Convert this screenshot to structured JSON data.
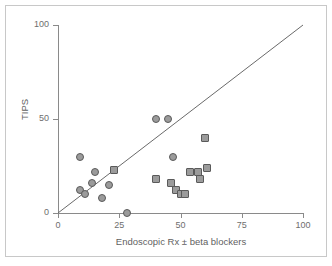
{
  "chart_data": {
    "type": "scatter",
    "title": "",
    "xlabel": "Endoscopic Rx ± beta blockers",
    "ylabel": "TIPS",
    "xlim": [
      0,
      100
    ],
    "ylim": [
      0,
      100
    ],
    "xticks": [
      0,
      25,
      50,
      75,
      100
    ],
    "yticks": [
      0,
      50,
      100
    ],
    "xtick_labels": [
      "0",
      "25",
      "50",
      "75",
      "100"
    ],
    "ytick_labels": [
      "0",
      "50",
      "100"
    ],
    "grid": false,
    "legend": null,
    "annotations": [
      {
        "name": "identity-line",
        "type": "line-of-equality",
        "from": [
          0,
          0
        ],
        "to": [
          100,
          100
        ]
      }
    ],
    "series": [
      {
        "name": "circles",
        "marker": "circle",
        "fill": "#9b9b9b",
        "edge": "#5a5a5a",
        "points": [
          {
            "x": 9,
            "y": 30
          },
          {
            "x": 15,
            "y": 22
          },
          {
            "x": 14,
            "y": 16
          },
          {
            "x": 9,
            "y": 12
          },
          {
            "x": 11,
            "y": 10
          },
          {
            "x": 21,
            "y": 15
          },
          {
            "x": 18,
            "y": 8
          },
          {
            "x": 28,
            "y": 0
          },
          {
            "x": 40,
            "y": 50
          },
          {
            "x": 45,
            "y": 50
          },
          {
            "x": 47,
            "y": 30
          }
        ]
      },
      {
        "name": "squares",
        "marker": "square",
        "fill": "#9b9b9b",
        "edge": "#5a5a5a",
        "points": [
          {
            "x": 23,
            "y": 23
          },
          {
            "x": 60,
            "y": 40
          },
          {
            "x": 61,
            "y": 24
          },
          {
            "x": 57,
            "y": 22
          },
          {
            "x": 54,
            "y": 22
          },
          {
            "x": 58,
            "y": 18
          },
          {
            "x": 40,
            "y": 18
          },
          {
            "x": 46,
            "y": 16
          },
          {
            "x": 48,
            "y": 12
          },
          {
            "x": 50,
            "y": 10
          },
          {
            "x": 52,
            "y": 10
          }
        ]
      }
    ]
  },
  "axes": {
    "x_title": "Endoscopic Rx ± beta blockers",
    "y_title": "TIPS"
  },
  "colors": {
    "marker_fill": "#9b9b9b",
    "marker_edge": "#5a5a5a",
    "axis": "#8a8a8a",
    "line": "#6a6a6a",
    "frame": "#c8c8c8",
    "text": "#6e6e6e"
  }
}
